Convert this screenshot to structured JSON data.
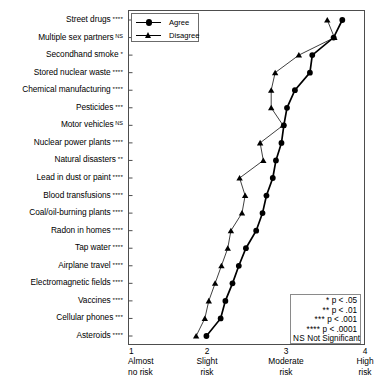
{
  "chart_data": {
    "type": "line",
    "title": "",
    "xlabel": "",
    "ylabel": "",
    "xlim": [
      1,
      4
    ],
    "grid": false,
    "orientation": "horizontal",
    "legend_position": "top-left",
    "xticks": [
      {
        "value": 1,
        "num": "1",
        "line1": "Almost",
        "line2": "no risk"
      },
      {
        "value": 2,
        "num": "2",
        "line1": "Slight",
        "line2": "risk"
      },
      {
        "value": 3,
        "num": "3",
        "line1": "Moderate",
        "line2": "risk"
      },
      {
        "value": 4,
        "num": "4",
        "line1": "High",
        "line2": "risk"
      }
    ],
    "categories": [
      {
        "label": "Street drugs",
        "sig": "****"
      },
      {
        "label": "Multiple sex partners",
        "sig": "NS"
      },
      {
        "label": "Secondhand smoke",
        "sig": "*"
      },
      {
        "label": "Stored nuclear waste",
        "sig": "****"
      },
      {
        "label": "Chemical manufacturing",
        "sig": "****"
      },
      {
        "label": "Pesticides",
        "sig": "***"
      },
      {
        "label": "Motor vehicles",
        "sig": "NS"
      },
      {
        "label": "Nuclear power plants",
        "sig": "****"
      },
      {
        "label": "Natural disasters",
        "sig": "**"
      },
      {
        "label": "Lead in dust or paint",
        "sig": "****"
      },
      {
        "label": "Blood transfusions",
        "sig": "****"
      },
      {
        "label": "Coal/oil-burning plants",
        "sig": "****"
      },
      {
        "label": "Radon in homes",
        "sig": "****"
      },
      {
        "label": "Tap water",
        "sig": "****"
      },
      {
        "label": "Airplane travel",
        "sig": "****"
      },
      {
        "label": "Electromagnetic fields",
        "sig": "****"
      },
      {
        "label": "Vaccines",
        "sig": "****"
      },
      {
        "label": "Cellular phones",
        "sig": "***"
      },
      {
        "label": "Asteroids",
        "sig": "****"
      }
    ],
    "series": [
      {
        "name": "Agree",
        "marker": "circle",
        "color": "#000000",
        "values": [
          3.7,
          3.59,
          3.32,
          3.29,
          3.1,
          3.0,
          2.96,
          2.93,
          2.86,
          2.82,
          2.74,
          2.69,
          2.61,
          2.48,
          2.39,
          2.31,
          2.22,
          2.16,
          1.98
        ]
      },
      {
        "name": "Disagree",
        "marker": "triangle",
        "color": "#000000",
        "values": [
          3.51,
          3.6,
          3.15,
          2.85,
          2.8,
          2.8,
          2.95,
          2.66,
          2.7,
          2.4,
          2.47,
          2.43,
          2.29,
          2.25,
          2.17,
          2.09,
          2.01,
          1.96,
          1.85
        ]
      }
    ],
    "annotations": [
      {
        "text": "* p < .05"
      },
      {
        "text": "** p < .01"
      },
      {
        "text": "*** p < .001"
      },
      {
        "text": "**** p < .0001"
      },
      {
        "text": "NS Not Significant"
      }
    ]
  },
  "significance_legend": {
    "rows": [
      {
        "stars": "*",
        "text": " p < .05"
      },
      {
        "stars": "**",
        "text": " p < .01"
      },
      {
        "stars": "***",
        "text": " p < .001"
      },
      {
        "stars": "****",
        "text": " p < .0001"
      },
      {
        "stars": "NS",
        "text": " Not Significant"
      }
    ]
  }
}
